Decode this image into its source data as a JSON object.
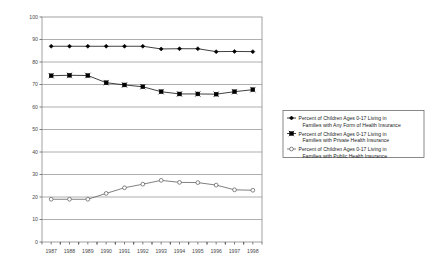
{
  "chart_data": {
    "type": "line",
    "title": "",
    "subtitle": "",
    "xlabel": "",
    "ylabel": "",
    "categories": [
      "1987",
      "1988",
      "1989",
      "1990",
      "1991",
      "1992",
      "1993",
      "1994",
      "1995",
      "1996",
      "1997",
      "1998"
    ],
    "x": [
      1987,
      1988,
      1989,
      1990,
      1991,
      1992,
      1993,
      1994,
      1995,
      1996,
      1997,
      1998
    ],
    "ylim": [
      0,
      100
    ],
    "ytick_step": 10,
    "yticks": [
      "0",
      "10",
      "20",
      "30",
      "40",
      "50",
      "60",
      "70",
      "80",
      "90",
      "100"
    ],
    "grid": true,
    "grid_axis": "y",
    "legend_position": "right-outside",
    "series": [
      {
        "name": "Percent of Children Ages 0-17 Living in Families with Any Form of Health Insurance",
        "marker": "filled-diamond",
        "color": "#000000",
        "values": [
          87.0,
          87.0,
          87.0,
          87.0,
          87.0,
          87.0,
          85.8,
          85.9,
          85.9,
          84.6,
          84.7,
          84.6
        ]
      },
      {
        "name": "Percent of Children Ages 0-17 Living in Families with Private Health Insurance",
        "marker": "crossed-square",
        "color": "#000000",
        "values": [
          73.9,
          74.1,
          74.0,
          70.8,
          69.8,
          69.0,
          66.8,
          65.8,
          65.8,
          65.7,
          66.8,
          67.7
        ]
      },
      {
        "name": "Percent of Children Ages 0-17 Living in Families with Public Health Insurance",
        "marker": "open-circle",
        "color": "#555555",
        "values": [
          19.0,
          19.0,
          19.0,
          21.6,
          24.1,
          25.7,
          27.4,
          26.5,
          26.4,
          25.3,
          23.2,
          23.0
        ]
      }
    ]
  },
  "legend": {
    "entries": [
      {
        "line1": "Percent of Children Ages 0-17 Living in",
        "line2": "Families with Any Form of Health Insurance",
        "marker": "filled-diamond"
      },
      {
        "line1": "Percent of Children Ages 0-17 Living in",
        "line2": "Families with Private Health Insurance",
        "marker": "crossed-square"
      },
      {
        "line1": "Percent of Children Ages 0-17 Living in",
        "line2": "Families with Public Health Insurance",
        "marker": "open-circle"
      }
    ]
  },
  "colors": {
    "plot_border": "#8a8a8a",
    "gridline": "#9b9b9b",
    "series_dark": "#000000",
    "series_gray": "#555555",
    "legend_border": "#6b6b6b",
    "tick_text": "#4a4a4a"
  }
}
